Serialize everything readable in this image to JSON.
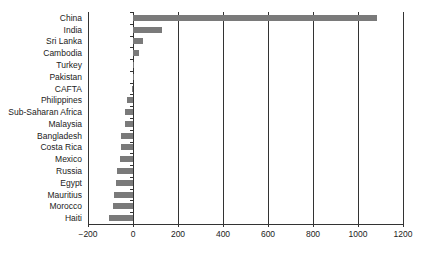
{
  "chart_data": {
    "type": "bar",
    "orientation": "horizontal",
    "title": "",
    "xlabel": "",
    "ylabel": "",
    "categories": [
      "China",
      "India",
      "Sri Lanka",
      "Cambodia",
      "Turkey",
      "Pakistan",
      "CAFTA",
      "Philippines",
      "Sub-Saharan Africa",
      "Malaysia",
      "Bangladesh",
      "Costa Rica",
      "Mexico",
      "Russia",
      "Egypt",
      "Mauritius",
      "Morocco",
      "Haiti"
    ],
    "values": [
      1085,
      129,
      45,
      27,
      2,
      -2,
      -4,
      -27,
      -35,
      -35,
      -53,
      -55,
      -58,
      -71,
      -76,
      -84,
      -89,
      -107
    ],
    "xlim": [
      -200,
      1200
    ],
    "xticks": [
      "−200",
      "0",
      "200",
      "400",
      "600",
      "800",
      "1000",
      "1200"
    ],
    "xtick_values": [
      -200,
      0,
      200,
      400,
      600,
      800,
      1000,
      1200
    ],
    "grid": "vertical",
    "legend": null,
    "bar_color": "#7a7a7a"
  }
}
